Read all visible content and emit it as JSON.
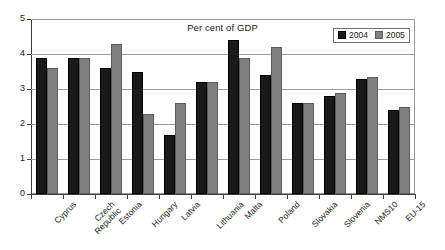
{
  "chart_data": {
    "type": "bar",
    "title": "Per cent of GDP",
    "xlabel": "",
    "ylabel": "",
    "ylim": [
      0,
      5
    ],
    "yticks": [
      0,
      1,
      2,
      3,
      4,
      5
    ],
    "grid": true,
    "legend_position": "top-right",
    "categories": [
      "Cyprus",
      "Czech Republic",
      "Estonia",
      "Hungary",
      "Latvia",
      "Lithuania",
      "Malta",
      "Poland",
      "Slovakia",
      "Slovenia",
      "NMS10",
      "EU-15"
    ],
    "series": [
      {
        "name": "2004",
        "color": "#1a1a1a",
        "values": [
          3.9,
          3.9,
          3.6,
          3.5,
          1.7,
          3.2,
          4.4,
          3.4,
          2.6,
          2.8,
          3.3,
          2.4
        ]
      },
      {
        "name": "2005",
        "color": "#808080",
        "values": [
          3.6,
          3.9,
          4.3,
          2.3,
          2.6,
          3.2,
          3.9,
          4.2,
          2.6,
          2.9,
          3.35,
          2.5
        ]
      }
    ]
  },
  "axis": {
    "y_tick_labels": [
      "0",
      "1",
      "2",
      "3",
      "4",
      "5"
    ]
  },
  "legend": {
    "entries": [
      {
        "label": "2004",
        "swatch": "black-swatch"
      },
      {
        "label": "2005",
        "swatch": "gray-swatch"
      }
    ]
  },
  "category_label_lines": [
    [
      "Cyprus",
      ""
    ],
    [
      "Czech",
      "Republic"
    ],
    [
      "Estonia",
      ""
    ],
    [
      "Hungary",
      ""
    ],
    [
      "Latvia",
      ""
    ],
    [
      "Lithuania",
      ""
    ],
    [
      "Malta",
      ""
    ],
    [
      "Poland",
      ""
    ],
    [
      "Slovakia",
      ""
    ],
    [
      "Slovenia",
      ""
    ],
    [
      "NMS10",
      ""
    ],
    [
      "EU-15",
      ""
    ]
  ]
}
